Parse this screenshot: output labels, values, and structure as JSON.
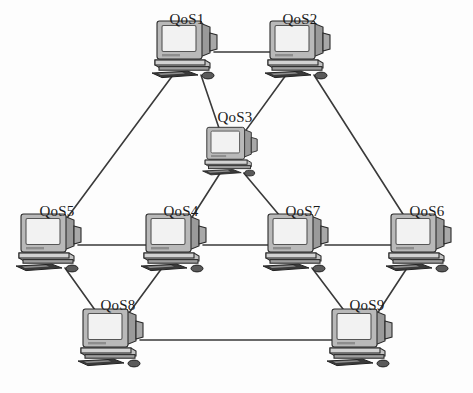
{
  "diagram": {
    "type": "network-topology",
    "background_color": "#fdfdfd",
    "line_color": "#3a3a3a",
    "label_color": "#1a1a1a",
    "icon": {
      "semantic_name": "desktop-computer-icon",
      "parts": [
        "crt-monitor",
        "system-base",
        "keyboard",
        "mouse"
      ],
      "monitor_screen_color": "#f2f2f2",
      "monitor_body_color": "#b9b9b9",
      "shadow_color": "#6e6e6e"
    },
    "nodes": [
      {
        "id": "QoS1",
        "label": "QoS1",
        "x": 187,
        "y": 50,
        "scale": 1.0,
        "label_x": 187,
        "label_y": 28
      },
      {
        "id": "QoS2",
        "label": "QoS2",
        "x": 300,
        "y": 50,
        "scale": 1.0,
        "label_x": 300,
        "label_y": 28
      },
      {
        "id": "QoS3",
        "label": "QoS3",
        "x": 232,
        "y": 152,
        "scale": 0.84,
        "label_x": 235,
        "label_y": 126
      },
      {
        "id": "QoS5",
        "label": "QoS5",
        "x": 51,
        "y": 243,
        "scale": 1.0,
        "label_x": 57,
        "label_y": 220
      },
      {
        "id": "QoS4",
        "label": "QoS4",
        "x": 176,
        "y": 243,
        "scale": 1.0,
        "label_x": 181,
        "label_y": 220
      },
      {
        "id": "QoS7",
        "label": "QoS7",
        "x": 298,
        "y": 243,
        "scale": 1.0,
        "label_x": 303,
        "label_y": 220
      },
      {
        "id": "QoS6",
        "label": "QoS6",
        "x": 421,
        "y": 243,
        "scale": 1.0,
        "label_x": 427,
        "label_y": 220
      },
      {
        "id": "QoS8",
        "label": "QoS8",
        "x": 113,
        "y": 338,
        "scale": 1.0,
        "label_x": 118,
        "label_y": 314
      },
      {
        "id": "QoS9",
        "label": "QoS9",
        "x": 362,
        "y": 338,
        "scale": 1.0,
        "label_x": 367,
        "label_y": 314
      }
    ],
    "edges": [
      {
        "from": "QoS1",
        "to": "QoS2",
        "kind": "horizontal"
      },
      {
        "from": "QoS1",
        "to": "QoS3",
        "kind": "diagonal"
      },
      {
        "from": "QoS1",
        "to": "QoS5",
        "kind": "diagonal"
      },
      {
        "from": "QoS2",
        "to": "QoS3",
        "kind": "diagonal"
      },
      {
        "from": "QoS2",
        "to": "QoS6",
        "kind": "diagonal"
      },
      {
        "from": "QoS3",
        "to": "QoS4",
        "kind": "diagonal"
      },
      {
        "from": "QoS3",
        "to": "QoS7",
        "kind": "diagonal"
      },
      {
        "from": "QoS5",
        "to": "QoS4",
        "kind": "horizontal"
      },
      {
        "from": "QoS4",
        "to": "QoS7",
        "kind": "horizontal"
      },
      {
        "from": "QoS7",
        "to": "QoS6",
        "kind": "horizontal"
      },
      {
        "from": "QoS5",
        "to": "QoS8",
        "kind": "diagonal"
      },
      {
        "from": "QoS4",
        "to": "QoS8",
        "kind": "diagonal"
      },
      {
        "from": "QoS7",
        "to": "QoS9",
        "kind": "diagonal"
      },
      {
        "from": "QoS6",
        "to": "QoS9",
        "kind": "diagonal"
      },
      {
        "from": "QoS8",
        "to": "QoS9",
        "kind": "horizontal"
      }
    ]
  }
}
